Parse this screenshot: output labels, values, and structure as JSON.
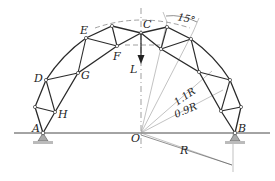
{
  "figure": {
    "nodes": {
      "A": "A",
      "B": "B",
      "C": "C",
      "D": "D",
      "E": "E",
      "F": "F",
      "G": "G",
      "H": "H",
      "O": "O"
    },
    "load_label": "L",
    "angle_label": "15°",
    "dimensions": {
      "outer_radius": "1.1R",
      "inner_radius": "0.9R",
      "span_radius": "R"
    },
    "colors": {
      "line": "#2a2a2a",
      "construction": "#888888",
      "support": "#9a9a9a"
    }
  }
}
